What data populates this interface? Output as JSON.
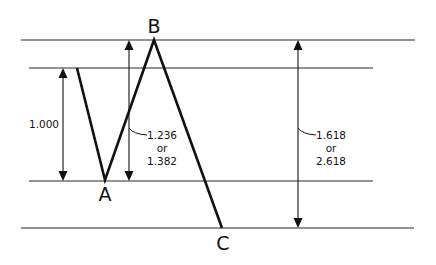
{
  "diagram": {
    "colors": {
      "background": "#ffffff",
      "ink": "#111111",
      "level_line": "#2a2a2a"
    },
    "levels": [
      {
        "name": "level-b-top",
        "y": 40,
        "x1": 21,
        "x2": 415
      },
      {
        "name": "level-start",
        "y": 68,
        "x1": 29,
        "x2": 373
      },
      {
        "name": "level-a",
        "y": 181,
        "x1": 29,
        "x2": 373
      },
      {
        "name": "level-c-bottom",
        "y": 228,
        "x1": 21,
        "x2": 414
      }
    ],
    "points": {
      "start": {
        "x": 77,
        "y": 68
      },
      "A": {
        "label": "A",
        "x": 105,
        "y": 180
      },
      "B": {
        "label": "B",
        "x": 154,
        "y": 40
      },
      "C": {
        "label": "C",
        "x": 222,
        "y": 228
      }
    },
    "measurements": [
      {
        "name": "measure-1000",
        "x": 63,
        "y_top": 68,
        "y_bottom": 181,
        "lines": [
          "1.000"
        ]
      },
      {
        "name": "measure-1236-1382",
        "x": 129,
        "y_top": 40,
        "y_bottom": 181,
        "lines": [
          "1.236",
          "or",
          "1.382"
        ]
      },
      {
        "name": "measure-1618-2618",
        "x": 298,
        "y_top": 40,
        "y_bottom": 228,
        "lines": [
          "1.618",
          "or",
          "2.618"
        ]
      }
    ]
  }
}
